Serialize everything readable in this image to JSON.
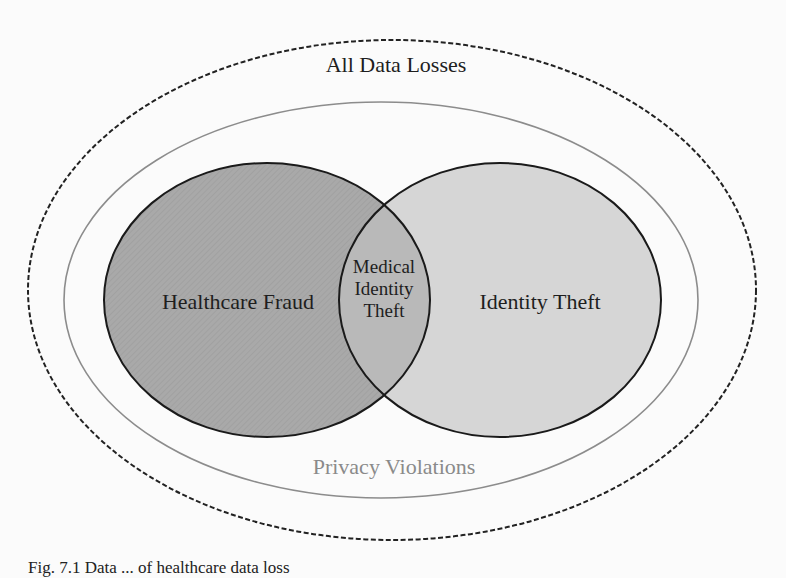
{
  "diagram": {
    "type": "venn / nested sets",
    "outer_set": {
      "label": "All Data Losses",
      "border": "dashed",
      "stroke": "#222222"
    },
    "middle_set": {
      "label": "Privacy Violations",
      "border": "solid",
      "stroke": "#8c8c8c",
      "label_color": "#8a8a8a"
    },
    "left_set": {
      "label": "Healthcare Fraud",
      "fill": "#a9a9a9",
      "stroke": "#1a1a1a"
    },
    "right_set": {
      "label": "Identity Theft",
      "fill": "#d6d6d6",
      "stroke": "#1a1a1a"
    },
    "intersection": {
      "label_lines": [
        "Medical",
        "Identity",
        "Theft"
      ],
      "fill": "#b9b9b9"
    }
  },
  "caption": "Fig. 7.1 Data ... of healthcare data loss"
}
